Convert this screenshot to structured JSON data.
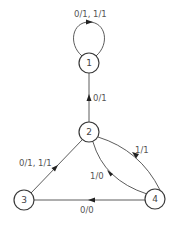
{
  "diagram": {
    "type": "state-diagram",
    "nodes": [
      {
        "id": "1",
        "label": "1"
      },
      {
        "id": "2",
        "label": "2"
      },
      {
        "id": "3",
        "label": "3"
      },
      {
        "id": "4",
        "label": "4"
      }
    ],
    "edges": [
      {
        "from": "1",
        "to": "1",
        "label": "0/1, 1/1"
      },
      {
        "from": "2",
        "to": "1",
        "label": "0/1"
      },
      {
        "from": "3",
        "to": "2",
        "label": "0/1, 1/1"
      },
      {
        "from": "4",
        "to": "2",
        "label": "1/1"
      },
      {
        "from": "2",
        "to": "4",
        "label": "1/0"
      },
      {
        "from": "4",
        "to": "3",
        "label": "0/0"
      }
    ]
  }
}
